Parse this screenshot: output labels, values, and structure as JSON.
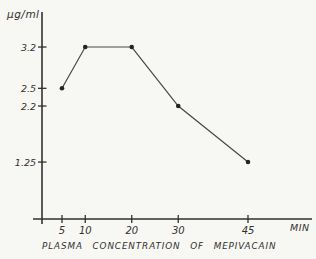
{
  "page": {
    "background": "#f7f7f4",
    "ink_color": "#33312e",
    "line_color": "#4a4845",
    "dot_color": "#262421"
  },
  "chart_data": {
    "type": "line",
    "title": "PLASMA CONCENTRATION OF MEPIVACAIN",
    "xlabel": "MIN",
    "ylabel": "µg/ml",
    "x": [
      5,
      10,
      20,
      30,
      45
    ],
    "y": [
      2.5,
      3.2,
      3.2,
      2.2,
      1.25
    ],
    "x_ticks": [
      "5",
      "10",
      "20",
      "30",
      "45"
    ],
    "x_tick_values": [
      5,
      10,
      20,
      30,
      45
    ],
    "y_ticks": [
      "3.2",
      "2.5",
      "2.2",
      "1.25"
    ],
    "y_tick_values": [
      3.2,
      2.5,
      2.2,
      1.25
    ],
    "xlim": [
      0.7,
      58
    ],
    "ylim": [
      0.285,
      3.8
    ],
    "grid": false,
    "legend": false,
    "marker": "filled-dot"
  }
}
